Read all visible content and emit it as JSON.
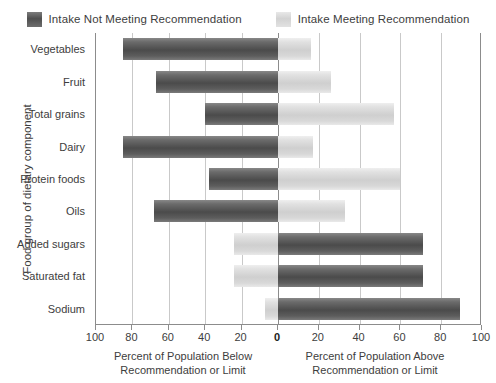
{
  "legend": {
    "entries": [
      {
        "label": "Intake Not Meeting Recommendation",
        "swatch": "dark",
        "color": "#545454"
      },
      {
        "label": "Intake Meeting Recommendation",
        "swatch": "light",
        "color": "#d6d6d6"
      }
    ]
  },
  "axes": {
    "y_title": "Food group of dietary component",
    "x_caption_left_line1": "Percent of Population Below",
    "x_caption_left_line2": "Recommendation or Limit",
    "x_caption_right_line1": "Percent of Population Above",
    "x_caption_right_line2": "Recommendation or Limit",
    "x_tick_labels": [
      "100",
      "80",
      "60",
      "40",
      "20",
      "0",
      "20",
      "40",
      "60",
      "80",
      "100"
    ]
  },
  "chart_data": {
    "type": "bar",
    "orientation": "horizontal",
    "subtype": "diverging-bidirectional",
    "title": "",
    "xlabel": "Percent of Population Below Recommendation or Limit | Percent of Population Above Recommendation or Limit",
    "ylabel": "Food group of dietary component",
    "xlim": [
      -100,
      100
    ],
    "xticks": [
      -100,
      -80,
      -60,
      -40,
      -20,
      0,
      20,
      40,
      60,
      80,
      100
    ],
    "xtick_labels": [
      "100",
      "80",
      "60",
      "40",
      "20",
      "0",
      "20",
      "40",
      "60",
      "80",
      "100"
    ],
    "grid": true,
    "legend_position": "top-center",
    "categories": [
      "Vegetables",
      "Fruit",
      "Total grains",
      "Dairy",
      "Protein foods",
      "Oils",
      "Added sugars",
      "Saturated fat",
      "Sodium"
    ],
    "series": [
      {
        "name": "Intake Not Meeting Recommendation",
        "color": "#545454",
        "values": [
          85,
          67,
          40,
          85,
          38,
          68,
          71,
          71,
          89
        ],
        "side": [
          "left",
          "left",
          "left",
          "left",
          "left",
          "left",
          "right",
          "right",
          "right"
        ]
      },
      {
        "name": "Intake Meeting Recommendation",
        "color": "#d6d6d6",
        "values": [
          16,
          26,
          57,
          17,
          60,
          33,
          24,
          24,
          7
        ],
        "side": [
          "right",
          "right",
          "right",
          "right",
          "right",
          "right",
          "left",
          "left",
          "left"
        ]
      }
    ],
    "bars": [
      {
        "category": "Vegetables",
        "not_meeting": 85,
        "not_meeting_side": "left",
        "meeting": 16,
        "meeting_side": "right"
      },
      {
        "category": "Fruit",
        "not_meeting": 67,
        "not_meeting_side": "left",
        "meeting": 26,
        "meeting_side": "right"
      },
      {
        "category": "Total grains",
        "not_meeting": 40,
        "not_meeting_side": "left",
        "meeting": 57,
        "meeting_side": "right"
      },
      {
        "category": "Dairy",
        "not_meeting": 85,
        "not_meeting_side": "left",
        "meeting": 17,
        "meeting_side": "right"
      },
      {
        "category": "Protein foods",
        "not_meeting": 38,
        "not_meeting_side": "left",
        "meeting": 60,
        "meeting_side": "right"
      },
      {
        "category": "Oils",
        "not_meeting": 68,
        "not_meeting_side": "left",
        "meeting": 33,
        "meeting_side": "right"
      },
      {
        "category": "Added sugars",
        "not_meeting": 71,
        "not_meeting_side": "right",
        "meeting": 24,
        "meeting_side": "left"
      },
      {
        "category": "Saturated fat",
        "not_meeting": 71,
        "not_meeting_side": "right",
        "meeting": 24,
        "meeting_side": "left"
      },
      {
        "category": "Sodium",
        "not_meeting": 89,
        "not_meeting_side": "right",
        "meeting": 7,
        "meeting_side": "left"
      }
    ]
  }
}
